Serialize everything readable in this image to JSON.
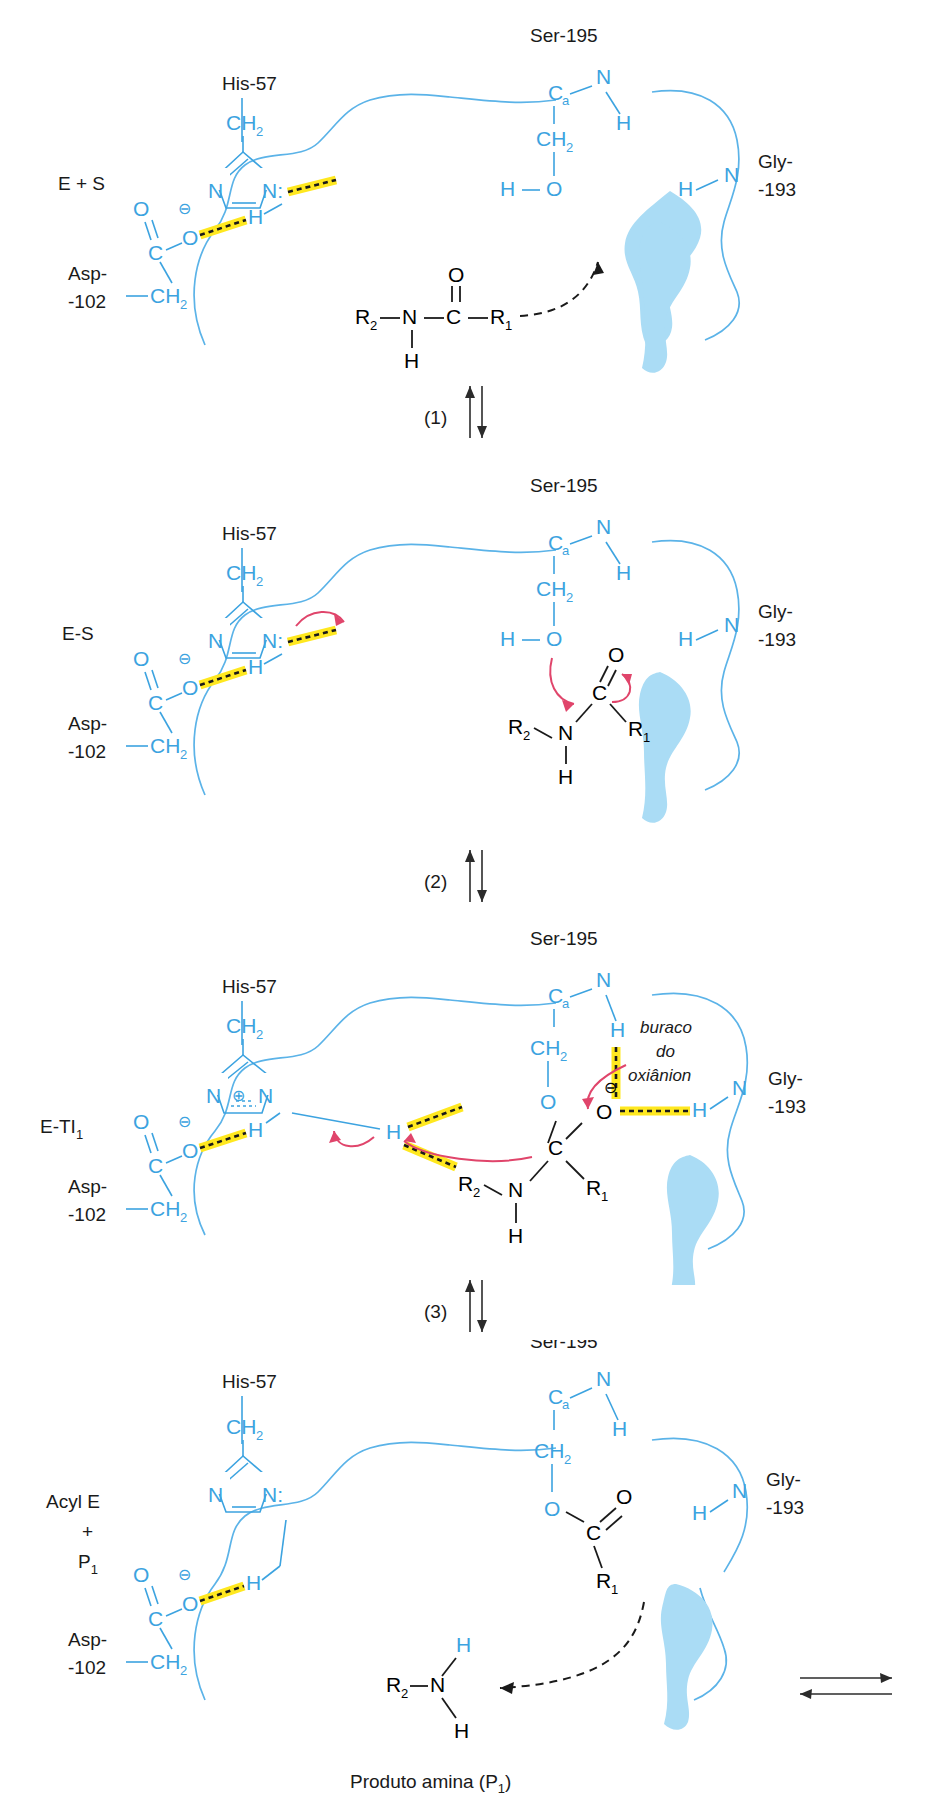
{
  "figure": {
    "language": "pt-BR",
    "colors": {
      "enzyme_blue": "#3ca3e0",
      "chain_blue": "#5bb3e8",
      "pocket_blue": "#aadcf5",
      "highlight_yellow": "#ffe81f",
      "arrow_pink": "#e0456b",
      "text_black": "#1a1a1a"
    }
  },
  "stages": [
    {
      "id": "stage-1",
      "state_label": "E + S",
      "residues": {
        "his": "His-57",
        "ser": "Ser-195",
        "asp_top": "Asp-",
        "asp_bot": "-102",
        "gly_top": "Gly-",
        "gly_bot": "-193"
      },
      "atoms": {
        "ser_ca": "C",
        "ser_ca_sub": "a",
        "ser_n": "N",
        "ser_nh": "H",
        "ser_ch2": "CH",
        "ser_ch2_sub": "2",
        "ser_o": "O",
        "ser_oh": "H",
        "his_ch2": "CH",
        "his_ch2_sub": "2",
        "his_n1": "N",
        "his_n3": "N:",
        "asp_o_dbl": "O",
        "asp_c": "C",
        "asp_o_minus": "O",
        "asp_charge": "⊖",
        "asp_ch2": "CH",
        "asp_ch2_sub": "2",
        "bridge_h": "H",
        "gly_n": "N",
        "gly_h": "H"
      },
      "substrate": {
        "r2": "R",
        "r2_sub": "2",
        "n": "N",
        "nh": "H",
        "c": "C",
        "o": "O",
        "r1": "R",
        "r1_sub": "1"
      }
    },
    {
      "id": "stage-2",
      "state_label": "E-S",
      "residues": {
        "his": "His-57",
        "ser": "Ser-195",
        "asp_top": "Asp-",
        "asp_bot": "-102",
        "gly_top": "Gly-",
        "gly_bot": "-193"
      },
      "atoms": {
        "ser_ca": "C",
        "ser_ca_sub": "a",
        "ser_n": "N",
        "ser_nh": "H",
        "ser_ch2": "CH",
        "ser_ch2_sub": "2",
        "ser_o": "O",
        "ser_oh": "H",
        "his_ch2": "CH",
        "his_ch2_sub": "2",
        "his_n1": "N",
        "his_n3": "N:",
        "asp_o_dbl": "O",
        "asp_c": "C",
        "asp_o_minus": "O",
        "asp_charge": "⊖",
        "asp_ch2": "CH",
        "asp_ch2_sub": "2",
        "bridge_h": "H",
        "gly_n": "N",
        "gly_h": "H"
      },
      "substrate": {
        "r2": "R",
        "r2_sub": "2",
        "n": "N",
        "nh": "H",
        "c": "C",
        "o": "O",
        "r1": "R",
        "r1_sub": "1"
      }
    },
    {
      "id": "stage-3",
      "state_label": "E-TI",
      "state_label_sub": "1",
      "oxyanion_line1": "buraco",
      "oxyanion_line2": "do",
      "oxyanion_line3": "oxiânion",
      "residues": {
        "his": "His-57",
        "ser": "Ser-195",
        "asp_top": "Asp-",
        "asp_bot": "-102",
        "gly_top": "Gly-",
        "gly_bot": "-193"
      },
      "atoms": {
        "ser_ca": "C",
        "ser_ca_sub": "a",
        "ser_n": "N",
        "ser_nh": "H",
        "ser_ch2": "CH",
        "ser_ch2_sub": "2",
        "ser_o": "O",
        "his_ch2": "CH",
        "his_ch2_sub": "2",
        "his_n1": "N",
        "his_n3": "N",
        "his_charge": "⊕",
        "asp_o_dbl": "O",
        "asp_c": "C",
        "asp_o_minus": "O",
        "asp_charge": "⊖",
        "asp_ch2": "CH",
        "asp_ch2_sub": "2",
        "bridge_h": "H",
        "gly_n": "N",
        "gly_h": "H",
        "shuttle_h": "H"
      },
      "intermediate": {
        "c": "C",
        "o_minus": "O",
        "o_charge": "⊖",
        "r1": "R",
        "r1_sub": "1",
        "n": "N",
        "nh": "H",
        "r2": "R",
        "r2_sub": "2"
      }
    },
    {
      "id": "stage-4",
      "state_label_line1": "Acyl E",
      "state_label_line2": "+",
      "state_label_line3": "P",
      "state_label_line3_sub": "1",
      "residues": {
        "his": "His-57",
        "ser": "Ser-195",
        "asp_top": "Asp-",
        "asp_bot": "-102",
        "gly_top": "Gly-",
        "gly_bot": "-193"
      },
      "atoms": {
        "ser_ca": "C",
        "ser_ca_sub": "a",
        "ser_n": "N",
        "ser_nh": "H",
        "ser_ch2": "CH",
        "ser_ch2_sub": "2",
        "ser_o": "O",
        "his_ch2": "CH",
        "his_ch2_sub": "2",
        "his_n1": "N",
        "his_n3": "N:",
        "asp_o_dbl": "O",
        "asp_c": "C",
        "asp_o_minus": "O",
        "asp_charge": "⊖",
        "asp_ch2": "CH",
        "asp_ch2_sub": "2",
        "bridge_h": "H",
        "gly_n": "N",
        "gly_h": "H"
      },
      "acyl": {
        "c": "C",
        "o": "O",
        "r1": "R",
        "r1_sub": "1"
      },
      "product": {
        "r2": "R",
        "r2_sub": "2",
        "n": "N",
        "h_top": "H",
        "h_bot": "H",
        "caption": "Produto amina (P",
        "caption_sub": "1",
        "caption_end": ")"
      }
    }
  ],
  "step_arrows": [
    {
      "id": "step-1",
      "label": "(1)"
    },
    {
      "id": "step-2",
      "label": "(2)"
    },
    {
      "id": "step-3",
      "label": "(3)"
    }
  ],
  "final_equilibrium": {
    "id": "final-equilibrium-arrow",
    "label": ""
  }
}
